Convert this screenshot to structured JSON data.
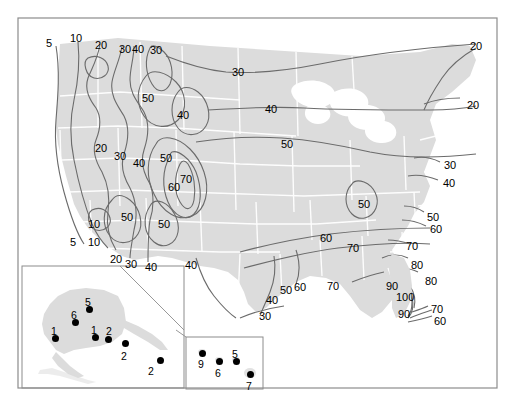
{
  "figure": {
    "type": "contour-map",
    "title": "",
    "colors": {
      "land": "#dcdcdc",
      "land_light": "#e6e6e6",
      "state_border": "#ffffff",
      "contour": "#6b6b6b",
      "frame": "#8c8c8c",
      "text": "#000000",
      "point": "#000000",
      "background": "#ffffff"
    },
    "frame": {
      "x": 18,
      "y": 18,
      "width": 479,
      "height": 370
    }
  },
  "chart_data": {
    "type": "contour",
    "title": "",
    "xlabel": "",
    "ylabel": "",
    "contour_levels": [
      5,
      10,
      20,
      30,
      40,
      50,
      60,
      70,
      80,
      90,
      100
    ],
    "units": "",
    "legend": "",
    "grid": false,
    "contour_labels": [
      {
        "value": "5",
        "x": 46,
        "y": 38
      },
      {
        "value": "10",
        "x": 70,
        "y": 33
      },
      {
        "value": "20",
        "x": 95,
        "y": 40
      },
      {
        "value": "30",
        "x": 119,
        "y": 44
      },
      {
        "value": "40",
        "x": 132,
        "y": 44
      },
      {
        "value": "30",
        "x": 150,
        "y": 45
      },
      {
        "value": "30",
        "x": 232,
        "y": 67
      },
      {
        "value": "20",
        "x": 470,
        "y": 41
      },
      {
        "value": "50",
        "x": 142,
        "y": 93
      },
      {
        "value": "40",
        "x": 177,
        "y": 110
      },
      {
        "value": "40",
        "x": 265,
        "y": 104
      },
      {
        "value": "20",
        "x": 467,
        "y": 100
      },
      {
        "value": "20",
        "x": 95,
        "y": 143
      },
      {
        "value": "30",
        "x": 114,
        "y": 151
      },
      {
        "value": "40",
        "x": 133,
        "y": 158
      },
      {
        "value": "50",
        "x": 160,
        "y": 153
      },
      {
        "value": "50",
        "x": 281,
        "y": 139
      },
      {
        "value": "30",
        "x": 444,
        "y": 160
      },
      {
        "value": "40",
        "x": 443,
        "y": 178
      },
      {
        "value": "70",
        "x": 180,
        "y": 174
      },
      {
        "value": "60",
        "x": 168,
        "y": 182
      },
      {
        "value": "50",
        "x": 358,
        "y": 199
      },
      {
        "value": "10",
        "x": 88,
        "y": 219
      },
      {
        "value": "50",
        "x": 121,
        "y": 212
      },
      {
        "value": "50",
        "x": 158,
        "y": 219
      },
      {
        "value": "50",
        "x": 427,
        "y": 212
      },
      {
        "value": "60",
        "x": 430,
        "y": 224
      },
      {
        "value": "5",
        "x": 70,
        "y": 237
      },
      {
        "value": "10",
        "x": 88,
        "y": 237
      },
      {
        "value": "60",
        "x": 320,
        "y": 233
      },
      {
        "value": "70",
        "x": 347,
        "y": 243
      },
      {
        "value": "70",
        "x": 406,
        "y": 241
      },
      {
        "value": "20",
        "x": 110,
        "y": 254
      },
      {
        "value": "30",
        "x": 125,
        "y": 259
      },
      {
        "value": "40",
        "x": 145,
        "y": 262
      },
      {
        "value": "40",
        "x": 185,
        "y": 260
      },
      {
        "value": "80",
        "x": 411,
        "y": 260
      },
      {
        "value": "50",
        "x": 280,
        "y": 285
      },
      {
        "value": "60",
        "x": 294,
        "y": 282
      },
      {
        "value": "70",
        "x": 327,
        "y": 281
      },
      {
        "value": "80",
        "x": 425,
        "y": 276
      },
      {
        "value": "90",
        "x": 386,
        "y": 281
      },
      {
        "value": "100",
        "x": 396,
        "y": 292
      },
      {
        "value": "40",
        "x": 266,
        "y": 295
      },
      {
        "value": "90",
        "x": 398,
        "y": 309
      },
      {
        "value": "70",
        "x": 431,
        "y": 304
      },
      {
        "value": "60",
        "x": 434,
        "y": 316
      },
      {
        "value": "30",
        "x": 259,
        "y": 311
      }
    ]
  },
  "insets": {
    "alaska": {
      "name": "Alaska inset",
      "box": {
        "x": 22,
        "y": 266,
        "width": 162,
        "height": 122
      },
      "points": [
        {
          "label": "5",
          "x": 89,
          "y": 309,
          "label_dx": -1,
          "label_dy": -12
        },
        {
          "label": "6",
          "x": 75,
          "y": 322,
          "label_dx": -1,
          "label_dy": -12
        },
        {
          "label": "1",
          "x": 55,
          "y": 338,
          "label_dx": -1,
          "label_dy": -12
        },
        {
          "label": "1",
          "x": 95,
          "y": 337,
          "label_dx": -1,
          "label_dy": -12
        },
        {
          "label": "2",
          "x": 108,
          "y": 339,
          "label_dx": 1,
          "label_dy": -13
        },
        {
          "label": "2",
          "x": 125,
          "y": 343,
          "label_dx": -1,
          "label_dy": 8
        },
        {
          "label": "2",
          "x": 160,
          "y": 360,
          "label_dx": -9,
          "label_dy": 6
        }
      ]
    },
    "hawaii": {
      "name": "Hawaii inset",
      "box": {
        "x": 186,
        "y": 337,
        "width": 77,
        "height": 52
      },
      "points": [
        {
          "label": "9",
          "x": 202,
          "y": 353,
          "label_dx": -1,
          "label_dy": 6
        },
        {
          "label": "6",
          "x": 219,
          "y": 361,
          "label_dx": -1,
          "label_dy": 7
        },
        {
          "label": "5",
          "x": 236,
          "y": 361,
          "label_dx": -1,
          "label_dy": -12
        },
        {
          "label": "7",
          "x": 250,
          "y": 374,
          "label_dx": -1,
          "label_dy": 7
        }
      ]
    }
  }
}
